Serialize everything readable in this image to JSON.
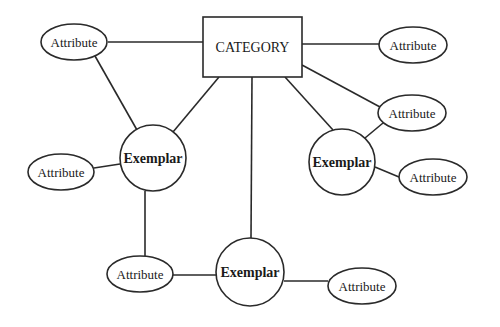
{
  "diagram": {
    "type": "concept-network",
    "colors": {
      "stroke": "#2a2a2a",
      "fill": "#ffffff",
      "text": "#1a1a1a"
    },
    "category": {
      "id": "category",
      "label": "CATEGORY",
      "shape": "rectangle",
      "x": 203,
      "y": 17,
      "w": 99,
      "h": 60
    },
    "nodes": [
      {
        "id": "attr_top_left",
        "label": "Attribute",
        "shape": "ellipse",
        "cx": 74,
        "cy": 42,
        "rx": 33,
        "ry": 18
      },
      {
        "id": "attr_top_right",
        "label": "Attribute",
        "shape": "ellipse",
        "cx": 413,
        "cy": 45,
        "rx": 34,
        "ry": 18
      },
      {
        "id": "attr_right_mid",
        "label": "Attribute",
        "shape": "ellipse",
        "cx": 412,
        "cy": 113,
        "rx": 34,
        "ry": 18
      },
      {
        "id": "exemplar_left",
        "label": "Exemplar",
        "shape": "circle",
        "cx": 153,
        "cy": 158,
        "r": 33
      },
      {
        "id": "exemplar_right",
        "label": "Exemplar",
        "shape": "circle",
        "cx": 342,
        "cy": 162,
        "r": 33
      },
      {
        "id": "attr_left",
        "label": "Attribute",
        "shape": "ellipse",
        "cx": 61,
        "cy": 172,
        "rx": 33,
        "ry": 18
      },
      {
        "id": "attr_right_low",
        "label": "Attribute",
        "shape": "ellipse",
        "cx": 433,
        "cy": 177,
        "rx": 34,
        "ry": 18
      },
      {
        "id": "attr_bottom_left",
        "label": "Attribute",
        "shape": "ellipse",
        "cx": 140,
        "cy": 274,
        "rx": 33,
        "ry": 18
      },
      {
        "id": "exemplar_bottom",
        "label": "Exemplar",
        "shape": "circle",
        "cx": 250,
        "cy": 272,
        "r": 34
      },
      {
        "id": "attr_bottom_right",
        "label": "Attribute",
        "shape": "ellipse",
        "cx": 362,
        "cy": 286,
        "rx": 34,
        "ry": 18
      }
    ],
    "edges": [
      {
        "from": "attr_top_left",
        "to": "category",
        "x1": 108,
        "y1": 42,
        "x2": 203,
        "y2": 42
      },
      {
        "from": "category",
        "to": "attr_top_right",
        "x1": 302,
        "y1": 44,
        "x2": 379,
        "y2": 44
      },
      {
        "from": "category",
        "to": "attr_right_mid",
        "x1": 302,
        "y1": 65,
        "x2": 380,
        "y2": 107
      },
      {
        "from": "attr_top_left",
        "to": "exemplar_left",
        "x1": 95,
        "y1": 56,
        "x2": 137,
        "y2": 130
      },
      {
        "from": "category",
        "to": "exemplar_left",
        "x1": 219,
        "y1": 77,
        "x2": 173,
        "y2": 132
      },
      {
        "from": "category",
        "to": "exemplar_right",
        "x1": 285,
        "y1": 77,
        "x2": 333,
        "y2": 130
      },
      {
        "from": "category",
        "to": "exemplar_bottom",
        "x1": 252,
        "y1": 77,
        "x2": 251,
        "y2": 238
      },
      {
        "from": "attr_right_mid",
        "to": "exemplar_right",
        "x1": 383,
        "y1": 123,
        "x2": 365,
        "y2": 138
      },
      {
        "from": "exemplar_right",
        "to": "attr_right_low",
        "x1": 375,
        "y1": 167,
        "x2": 399,
        "y2": 177
      },
      {
        "from": "attr_left",
        "to": "exemplar_left",
        "x1": 94,
        "y1": 168,
        "x2": 120,
        "y2": 164
      },
      {
        "from": "exemplar_left",
        "to": "attr_bottom_left",
        "x1": 145,
        "y1": 191,
        "x2": 145,
        "y2": 256
      },
      {
        "from": "attr_bottom_left",
        "to": "exemplar_bottom",
        "x1": 173,
        "y1": 275,
        "x2": 216,
        "y2": 275
      },
      {
        "from": "exemplar_bottom",
        "to": "attr_bottom_right",
        "x1": 284,
        "y1": 281,
        "x2": 328,
        "y2": 281
      }
    ]
  }
}
